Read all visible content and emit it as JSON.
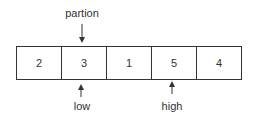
{
  "array": {
    "values": [
      "2",
      "3",
      "1",
      "5",
      "4"
    ]
  },
  "pointers": {
    "partition": {
      "label": "partion",
      "index": 1,
      "position": "above"
    },
    "low": {
      "label": "low",
      "index": 1,
      "position": "below"
    },
    "high": {
      "label": "high",
      "index": 3,
      "position": "below"
    }
  }
}
